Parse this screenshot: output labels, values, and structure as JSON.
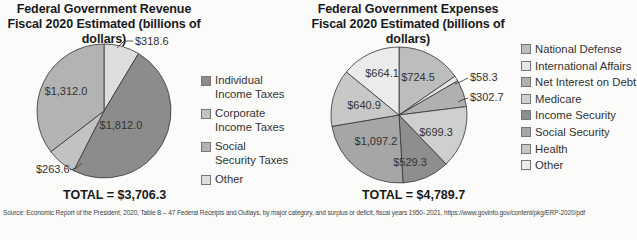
{
  "chart_data": [
    {
      "type": "pie",
      "title": "Federal Government Revenue",
      "subtitle": "Fiscal 2020 Estimated (billions of dollars)",
      "categories": [
        "Individual Income Taxes",
        "Corporate Income Taxes",
        "Social Security Taxes",
        "Other"
      ],
      "values": [
        1812.0,
        263.6,
        1312.0,
        318.6
      ],
      "value_labels": [
        "$1,812.0",
        "$263.6",
        "$1,312.0",
        "$318.6"
      ],
      "colors": [
        "#8c8c8c",
        "#c2c2c2",
        "#b3b3b3",
        "#dedede"
      ],
      "total_label": "TOTAL = $3,706.3",
      "legend_position": "right"
    },
    {
      "type": "pie",
      "title": "Federal Government Expenses",
      "subtitle": "Fiscal 2020 Estimated (billions of dollars)",
      "categories": [
        "National Defense",
        "International Affairs",
        "Net Interest on Debt",
        "Medicare",
        "Income Security",
        "Social Security",
        "Health",
        "Other"
      ],
      "values": [
        724.5,
        58.3,
        302.7,
        699.3,
        529.3,
        1097.2,
        640.9,
        664.1
      ],
      "value_labels": [
        "$724.5",
        "$58.3",
        "$302.7",
        "$699.3",
        "$529.3",
        "$1,097.2",
        "$640.9",
        "$664.1"
      ],
      "colors": [
        "#bdbdbd",
        "#e6e6e6",
        "#b0b0b0",
        "#cfcfcf",
        "#8e8e8e",
        "#a6a6a6",
        "#c8c8c8",
        "#ebebeb"
      ],
      "total_label": "TOTAL = $4,789.7",
      "legend_position": "right"
    }
  ],
  "revenue": {
    "title_line1": "Federal Government Revenue",
    "title_line2": "Fiscal 2020 Estimated (billions of dollars)",
    "legend": [
      {
        "label": "Individual Income Taxes",
        "line1": "Individual",
        "line2": "Income Taxes",
        "color": "#8c8c8c"
      },
      {
        "label": "Corporate Income Taxes",
        "line1": "Corporate",
        "line2": "Income Taxes",
        "color": "#c2c2c2"
      },
      {
        "label": "Social Security Taxes",
        "line1": "Social",
        "line2": "Security Taxes",
        "color": "#b3b3b3"
      },
      {
        "label": "Other",
        "line1": "Other",
        "line2": "",
        "color": "#dedede"
      }
    ],
    "labels": {
      "other": "$318.6",
      "individual": "$1,812.0",
      "corporate": "$263.6",
      "social": "$1,312.0"
    },
    "total": "TOTAL = $3,706.3"
  },
  "expenses": {
    "title_line1": "Federal Government Expenses",
    "title_line2": "Fiscal 2020 Estimated (billions of dollars)",
    "legend": [
      {
        "label": "National Defense",
        "color": "#bdbdbd"
      },
      {
        "label": "International Affairs",
        "color": "#e6e6e6"
      },
      {
        "label": "Net Interest on Debt",
        "color": "#b0b0b0"
      },
      {
        "label": "Medicare",
        "color": "#cfcfcf"
      },
      {
        "label": "Income Security",
        "color": "#8e8e8e"
      },
      {
        "label": "Social Security",
        "color": "#a6a6a6"
      },
      {
        "label": "Health",
        "color": "#c8c8c8"
      },
      {
        "label": "Other",
        "color": "#ebebeb"
      }
    ],
    "labels": {
      "defense": "$724.5",
      "international": "$58.3",
      "interest": "$302.7",
      "medicare": "$699.3",
      "income_security": "$529.3",
      "social_security": "$1,097.2",
      "health": "$640.9",
      "other": "$664.1"
    },
    "total": "TOTAL = $4,789.7"
  },
  "source": "Source: Economic Report of the President, 2020, Table B – 47 Federal Receipts and Outlays, by major category, and surplus or deficit, fiscal years 1950- 2021, https://www.govinfo.gov/content/pkg/ERP-2020/pdf"
}
